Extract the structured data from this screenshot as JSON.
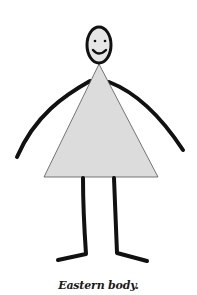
{
  "figure": {
    "caption": "Eastern body.",
    "colors": {
      "stroke": "#111111",
      "torso_fill": "#dcdcdc",
      "head_fill": "#e6e6e6",
      "background": "#ffffff"
    },
    "parts": [
      "head",
      "smile",
      "eyes",
      "torso-triangle",
      "left-arm",
      "right-arm",
      "left-leg",
      "right-leg"
    ]
  }
}
